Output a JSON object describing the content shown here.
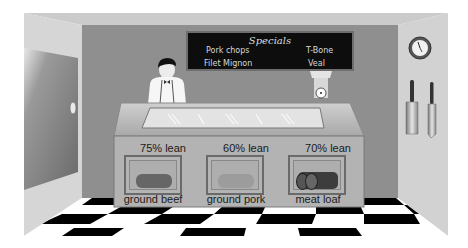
{
  "scene": "Butcher shop counter",
  "specials_board": {
    "title": "Specials",
    "items": [
      "Pork chops",
      "T-Bone",
      "Filet Mignon",
      "Veal"
    ]
  },
  "products": [
    {
      "lean": "75% lean",
      "name": "ground beef",
      "color": "#6a6a6a"
    },
    {
      "lean": "60% lean",
      "name": "ground pork",
      "color": "#9a9a9a"
    },
    {
      "lean": "70% lean",
      "name": "meat loaf",
      "color": "#3e3e3e"
    }
  ],
  "colors": {
    "back_wall": "#8f8f8f",
    "side_wall": "#d4d4d4",
    "ceiling": "#c8c8c8",
    "board": "#0d0d0d",
    "floor_dark": "#000000",
    "floor_light": "#ffffff"
  }
}
